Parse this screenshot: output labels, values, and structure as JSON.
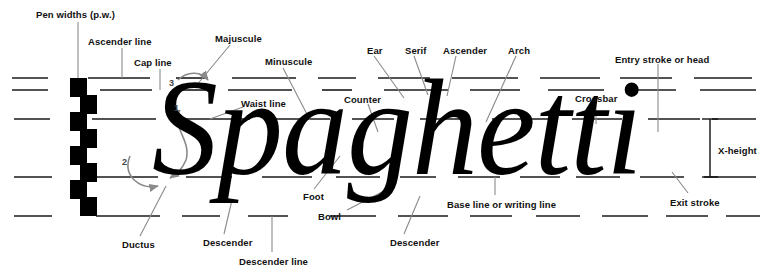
{
  "figure": {
    "sample_word": "Spaghetti",
    "background_color": "#ffffff",
    "ink_color": "#000000",
    "guide_line_color": "#1a1a1a",
    "leader_line_color": "#8a8a8a",
    "label_color": "#111111"
  },
  "guide_lines": [
    {
      "name": "ascender-line",
      "y": 78
    },
    {
      "name": "cap-line",
      "y": 90
    },
    {
      "name": "waist-line",
      "y": 119
    },
    {
      "name": "base-line",
      "y": 177
    },
    {
      "name": "descender-line",
      "y": 216
    }
  ],
  "labels": [
    {
      "id": "pen-widths",
      "text": "Pen widths (p.w.)",
      "x": 36,
      "y": 10
    },
    {
      "id": "ascender-line",
      "text": "Ascender line",
      "x": 88,
      "y": 37
    },
    {
      "id": "cap-line",
      "text": "Cap line",
      "x": 134,
      "y": 58
    },
    {
      "id": "majuscule",
      "text": "Majuscule",
      "x": 215,
      "y": 34
    },
    {
      "id": "minuscule",
      "text": "Minuscule",
      "x": 265,
      "y": 57
    },
    {
      "id": "waist-line",
      "text": "Waist line",
      "x": 241,
      "y": 99
    },
    {
      "id": "counter-left",
      "text": "Counter",
      "x": 344,
      "y": 95
    },
    {
      "id": "ear",
      "text": "Ear",
      "x": 367,
      "y": 46
    },
    {
      "id": "serif",
      "text": "Serif",
      "x": 405,
      "y": 46
    },
    {
      "id": "ascender",
      "text": "Ascender",
      "x": 443,
      "y": 46
    },
    {
      "id": "arch",
      "text": "Arch",
      "x": 508,
      "y": 46
    },
    {
      "id": "crossbar",
      "text": "Crossbar",
      "x": 575,
      "y": 94
    },
    {
      "id": "entry-stroke",
      "text": "Entry stroke or head",
      "x": 615,
      "y": 55
    },
    {
      "id": "x-height",
      "text": "X-height",
      "x": 718,
      "y": 146
    },
    {
      "id": "exit-stroke",
      "text": "Exit stroke",
      "x": 670,
      "y": 198
    },
    {
      "id": "base-line",
      "text": "Base line or writing line",
      "x": 447,
      "y": 200
    },
    {
      "id": "foot",
      "text": "Foot",
      "x": 303,
      "y": 192
    },
    {
      "id": "bowl",
      "text": "Bowl",
      "x": 318,
      "y": 212
    },
    {
      "id": "ductus",
      "text": "Ductus",
      "x": 122,
      "y": 240
    },
    {
      "id": "descender-left",
      "text": "Descender",
      "x": 203,
      "y": 238
    },
    {
      "id": "descender-line",
      "text": "Descender line",
      "x": 239,
      "y": 257
    },
    {
      "id": "descender-right",
      "text": "Descender",
      "x": 390,
      "y": 238
    }
  ],
  "ductus_numbers": [
    {
      "id": "stroke-1",
      "text": "1",
      "x": 174,
      "y": 104
    },
    {
      "id": "stroke-2",
      "text": "2",
      "x": 122,
      "y": 158
    },
    {
      "id": "stroke-3",
      "text": "3",
      "x": 169,
      "y": 79
    }
  ],
  "pen_width_stack": {
    "name": "pen-width-ladder",
    "step_count": 8,
    "step_width": 17,
    "step_height": 19,
    "x": 70,
    "y": 78
  }
}
